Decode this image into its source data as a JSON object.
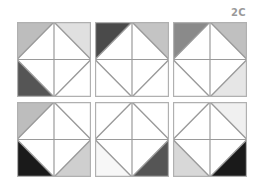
{
  "label": "2C",
  "colors": {
    "white": "#ffffff",
    "very_light": "#ececec",
    "light": "#d6d6d6",
    "light_medium": "#bdbdbd",
    "medium": "#8a8a8a",
    "dark": "#4f4f4f",
    "black": "#1a1a1a",
    "line": "#9a9a9a"
  },
  "tiles": [
    {
      "row": 0,
      "col": 0,
      "corners": {
        "tl": "#bdbdbd",
        "tr": "#e0e0e0",
        "bl": "#555555",
        "br": "#ffffff"
      }
    },
    {
      "row": 0,
      "col": 1,
      "corners": {
        "tl": "#4a4a4a",
        "tr": "#c4c4c4",
        "bl": "#ffffff",
        "br": "#ffffff"
      }
    },
    {
      "row": 0,
      "col": 2,
      "corners": {
        "tl": "#8a8a8a",
        "tr": "#c0c0c0",
        "bl": "#ffffff",
        "br": "#e6e6e6"
      }
    },
    {
      "row": 1,
      "col": 0,
      "corners": {
        "tl": "#bdbdbd",
        "tr": "#ffffff",
        "bl": "#1a1a1a",
        "br": "#cfcfcf"
      }
    },
    {
      "row": 1,
      "col": 1,
      "corners": {
        "tl": "#ffffff",
        "tr": "#ffffff",
        "bl": "#f7f7f7",
        "br": "#555555"
      }
    },
    {
      "row": 1,
      "col": 2,
      "corners": {
        "tl": "#ffffff",
        "tr": "#f0f0f0",
        "bl": "#d8d8d8",
        "br": "#1a1a1a"
      }
    }
  ]
}
